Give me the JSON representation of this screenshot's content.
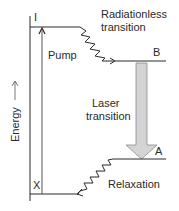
{
  "diagram": {
    "type": "energy-level-diagram",
    "axis": {
      "label": "Energy"
    },
    "levels": [
      {
        "id": "I",
        "label": "I"
      },
      {
        "id": "B",
        "label": "B"
      },
      {
        "id": "A",
        "label": "A"
      },
      {
        "id": "X",
        "label": "X"
      }
    ],
    "transitions": [
      {
        "from": "X",
        "to": "I",
        "label": "Pump",
        "style": "arrow"
      },
      {
        "from": "I",
        "to": "B",
        "label_line1": "Radiationless",
        "label_line2": "transition",
        "style": "zigzag"
      },
      {
        "from": "B",
        "to": "A",
        "label_line1": "Laser",
        "label_line2": "transition",
        "style": "thick-gray-arrow"
      },
      {
        "from": "A",
        "to": "X",
        "label": "Relaxation",
        "style": "zigzag"
      }
    ],
    "colors": {
      "line": "#2a2a2a",
      "laser_arrow_fill": "#d4d4d4",
      "laser_arrow_stroke": "#8a8a8a"
    }
  }
}
